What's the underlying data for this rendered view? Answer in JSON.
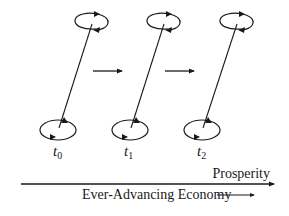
{
  "diagram": {
    "time_steps": [
      {
        "label": "t",
        "subscript": "0",
        "top": {
          "cx": 91,
          "cy": 22
        },
        "bottom": {
          "cx": 58,
          "cy": 130
        },
        "label_x": 53,
        "label_y": 156
      },
      {
        "label": "t",
        "subscript": "1",
        "top": {
          "cx": 163,
          "cy": 22
        },
        "bottom": {
          "cx": 130,
          "cy": 130
        },
        "label_x": 124,
        "label_y": 156
      },
      {
        "label": "t",
        "subscript": "2",
        "top": {
          "cx": 236,
          "cy": 22
        },
        "bottom": {
          "cx": 202,
          "cy": 130
        },
        "label_x": 197,
        "label_y": 156
      }
    ],
    "transition_arrows": [
      {
        "from": "t0",
        "to": "t1"
      },
      {
        "from": "t1",
        "to": "t2"
      }
    ],
    "axis": {
      "label_top": "Prosperity",
      "label_bottom": "Ever-Advancing Economy"
    },
    "colors": {
      "stroke": "#1a1a1a",
      "background": "#ffffff"
    }
  }
}
